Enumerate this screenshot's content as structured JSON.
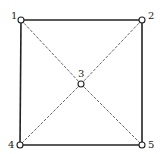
{
  "diagram": {
    "type": "graph",
    "nodes": [
      {
        "id": "1",
        "label": "1",
        "x": 21,
        "y": 20,
        "label_x": 11,
        "label_y": 19
      },
      {
        "id": "2",
        "label": "2",
        "x": 142,
        "y": 20,
        "label_x": 148,
        "label_y": 19
      },
      {
        "id": "3",
        "label": "3",
        "x": 81,
        "y": 84,
        "label_x": 78,
        "label_y": 77
      },
      {
        "id": "4",
        "label": "4",
        "x": 20,
        "y": 145,
        "label_x": 8,
        "label_y": 148
      },
      {
        "id": "5",
        "label": "5",
        "x": 142,
        "y": 145,
        "label_x": 148,
        "label_y": 148
      }
    ],
    "edges": [
      {
        "from": "1",
        "to": "2",
        "style": "solid"
      },
      {
        "from": "2",
        "to": "5",
        "style": "solid"
      },
      {
        "from": "5",
        "to": "4",
        "style": "solid"
      },
      {
        "from": "4",
        "to": "1",
        "style": "solid"
      },
      {
        "from": "1",
        "to": "3",
        "style": "dashed"
      },
      {
        "from": "3",
        "to": "5",
        "style": "dashed"
      },
      {
        "from": "2",
        "to": "3",
        "style": "dashed"
      },
      {
        "from": "3",
        "to": "4",
        "style": "dashed"
      }
    ],
    "colors": {
      "line": "#222222",
      "background": "#ffffff"
    }
  }
}
